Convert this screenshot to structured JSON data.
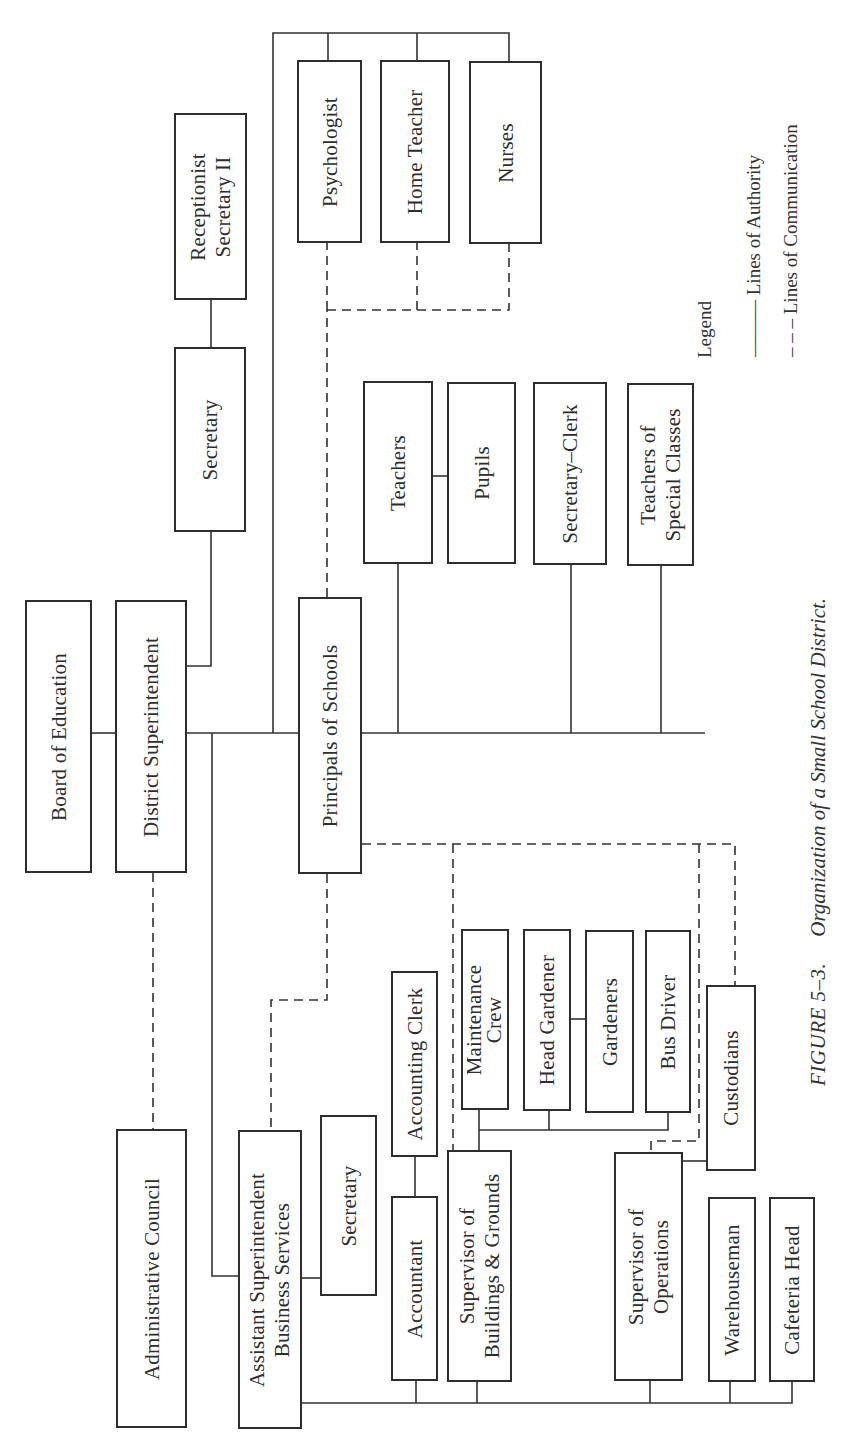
{
  "caption": {
    "figure_label": "FIGURE 5–3.",
    "title": "Organization of a Small School District."
  },
  "legend": {
    "title": "Legend",
    "items": [
      {
        "symbol": "———",
        "label": "Lines of Authority",
        "style": "solid"
      },
      {
        "symbol": "– – –",
        "label": "Lines of Communication",
        "style": "dashed"
      }
    ]
  },
  "nodes": {
    "board": {
      "lines": [
        "Board of Education"
      ]
    },
    "district_supt": {
      "lines": [
        "District Superintendent"
      ]
    },
    "secretary_top": {
      "lines": [
        "Secretary"
      ]
    },
    "receptionist": {
      "lines": [
        "Receptionist",
        "Secretary II"
      ]
    },
    "psychologist": {
      "lines": [
        "Psychologist"
      ]
    },
    "home_teacher": {
      "lines": [
        "Home Teacher"
      ]
    },
    "nurses": {
      "lines": [
        "Nurses"
      ]
    },
    "principals": {
      "lines": [
        "Principals of Schools"
      ]
    },
    "teachers": {
      "lines": [
        "Teachers"
      ]
    },
    "pupils": {
      "lines": [
        "Pupils"
      ]
    },
    "secretary_clerk": {
      "lines": [
        "Secretary–Clerk"
      ]
    },
    "teachers_special": {
      "lines": [
        "Teachers of",
        "Special Classes"
      ]
    },
    "admin_council": {
      "lines": [
        "Administrative Council"
      ]
    },
    "asst_supt": {
      "lines": [
        "Assistant Superintendent",
        "Business Services"
      ]
    },
    "secretary_bus": {
      "lines": [
        "Secretary"
      ]
    },
    "accounting_clerk": {
      "lines": [
        "Accounting Clerk"
      ]
    },
    "accountant": {
      "lines": [
        "Accountant"
      ]
    },
    "supv_buildings": {
      "lines": [
        "Supervisor of",
        "Buildings & Grounds"
      ]
    },
    "maintenance": {
      "lines": [
        "Maintenance",
        "Crew"
      ]
    },
    "head_gardener": {
      "lines": [
        "Head Gardener"
      ]
    },
    "gardeners": {
      "lines": [
        "Gardeners"
      ]
    },
    "bus_driver": {
      "lines": [
        "Bus Driver"
      ]
    },
    "custodians": {
      "lines": [
        "Custodians"
      ]
    },
    "supv_operations": {
      "lines": [
        "Supervisor of",
        "Operations"
      ]
    },
    "warehouseman": {
      "lines": [
        "Warehouseman"
      ]
    },
    "cafeteria_head": {
      "lines": [
        "Cafeteria Head"
      ]
    }
  },
  "colors": {
    "ink": "#2e2e2e",
    "paper": "#ffffff"
  }
}
